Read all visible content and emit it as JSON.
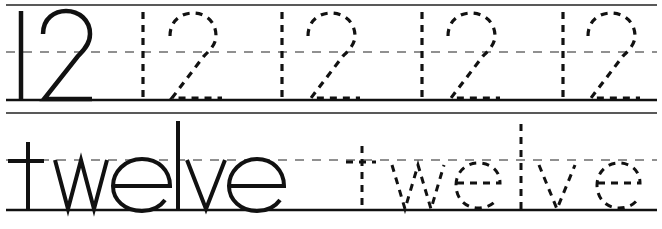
{
  "worksheet": {
    "number_row": {
      "model_text": "12",
      "trace_text": "12",
      "trace_count": 4
    },
    "word_row": {
      "model_text": "twelve",
      "trace_text": "twelve",
      "trace_count": 1
    }
  },
  "colors": {
    "ink": "#111111",
    "rule": "#222222",
    "background": "#ffffff"
  }
}
